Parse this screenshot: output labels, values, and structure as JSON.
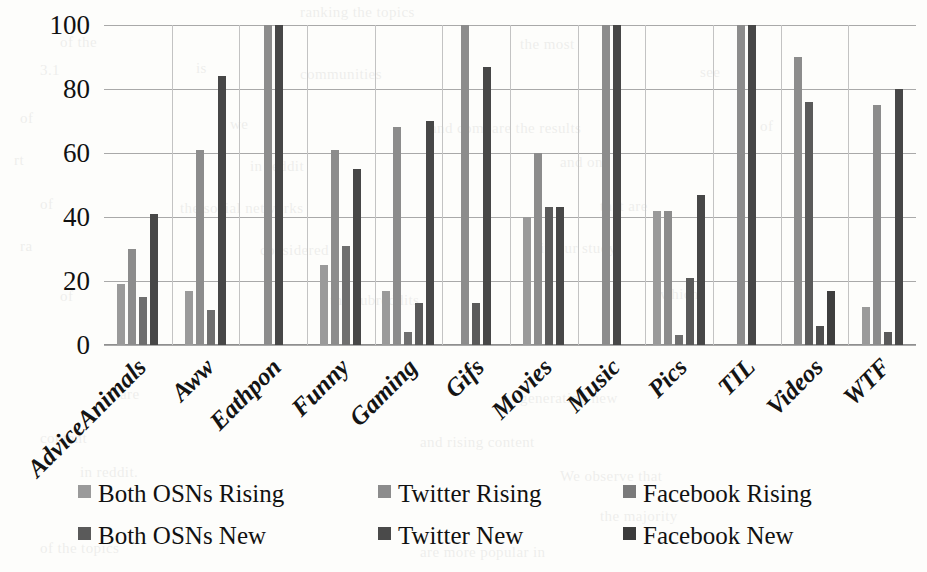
{
  "chart_data": {
    "type": "bar",
    "title": "",
    "subtitle": "",
    "xlabel": "",
    "ylabel": "",
    "grid": true,
    "legend_position": "bottom",
    "ylim": [
      0,
      100
    ],
    "yticks": [
      "0",
      "20",
      "40",
      "60",
      "80",
      "100"
    ],
    "categories": [
      "AdviceAnimals",
      "Aww",
      "Eathpon",
      "Funny",
      "Gaming",
      "Gifs",
      "Movies",
      "Music",
      "Pics",
      "TIL",
      "Videos",
      "WTF"
    ],
    "series": [
      {
        "name": "Both OSNs Rising",
        "color": "#9a9a9a",
        "values": [
          19,
          17,
          null,
          25,
          17,
          null,
          40,
          null,
          42,
          null,
          null,
          12
        ]
      },
      {
        "name": "Twitter Rising",
        "color": "#8c8c8c",
        "values": [
          30,
          61,
          100,
          61,
          68,
          100,
          60,
          100,
          42,
          100,
          90,
          75
        ]
      },
      {
        "name": "Facebook Rising",
        "color": "#787878",
        "values": [
          15,
          null,
          null,
          null,
          4,
          null,
          null,
          null,
          3,
          null,
          null,
          null
        ]
      },
      {
        "name": "Both OSNs New",
        "color": "#555555",
        "values": [
          null,
          11,
          null,
          31,
          13,
          13,
          43,
          null,
          21,
          null,
          6,
          4
        ]
      },
      {
        "name": "Twitter New",
        "color": "#4a4a4a",
        "values": [
          41,
          84,
          100,
          55,
          70,
          87,
          43,
          100,
          47,
          100,
          76,
          80
        ]
      },
      {
        "name": "Facebook New",
        "color": "#3b3b3b",
        "values": [
          null,
          null,
          null,
          null,
          null,
          null,
          null,
          null,
          null,
          null,
          17,
          null
        ]
      }
    ],
    "bars": [
      {
        "category": "AdviceAnimals",
        "items": [
          {
            "series": "Both OSNs Rising",
            "value": 19,
            "color": "#9a9a9a"
          },
          {
            "series": "Twitter Rising",
            "value": 30,
            "color": "#8c8c8c"
          },
          {
            "series": "Facebook Rising",
            "value": 15,
            "color": "#6f6f6f"
          },
          {
            "series": "Twitter New",
            "value": 41,
            "color": "#474747"
          }
        ]
      },
      {
        "category": "Aww",
        "items": [
          {
            "series": "Both OSNs Rising",
            "value": 17,
            "color": "#9a9a9a"
          },
          {
            "series": "Twitter Rising",
            "value": 61,
            "color": "#8c8c8c"
          },
          {
            "series": "Both OSNs New",
            "value": 11,
            "color": "#6f6f6f"
          },
          {
            "series": "Twitter New",
            "value": 84,
            "color": "#474747"
          }
        ]
      },
      {
        "category": "Eathpon",
        "items": [
          {
            "series": "Twitter Rising",
            "value": 100,
            "color": "#8c8c8c"
          },
          {
            "series": "Twitter New",
            "value": 100,
            "color": "#474747"
          }
        ]
      },
      {
        "category": "Funny",
        "items": [
          {
            "series": "Both OSNs Rising",
            "value": 25,
            "color": "#9a9a9a"
          },
          {
            "series": "Twitter Rising",
            "value": 61,
            "color": "#8c8c8c"
          },
          {
            "series": "Both OSNs New",
            "value": 31,
            "color": "#6f6f6f"
          },
          {
            "series": "Twitter New",
            "value": 55,
            "color": "#474747"
          }
        ]
      },
      {
        "category": "Gaming",
        "items": [
          {
            "series": "Both OSNs Rising",
            "value": 17,
            "color": "#9a9a9a"
          },
          {
            "series": "Twitter Rising",
            "value": 68,
            "color": "#8c8c8c"
          },
          {
            "series": "Facebook Rising",
            "value": 4,
            "color": "#6f6f6f"
          },
          {
            "series": "Both OSNs New",
            "value": 13,
            "color": "#5a5a5a"
          },
          {
            "series": "Twitter New",
            "value": 70,
            "color": "#474747"
          }
        ]
      },
      {
        "category": "Gifs",
        "items": [
          {
            "series": "Twitter Rising",
            "value": 100,
            "color": "#8c8c8c"
          },
          {
            "series": "Both OSNs New",
            "value": 13,
            "color": "#5a5a5a"
          },
          {
            "series": "Twitter New",
            "value": 87,
            "color": "#474747"
          }
        ]
      },
      {
        "category": "Movies",
        "items": [
          {
            "series": "Both OSNs Rising",
            "value": 40,
            "color": "#9a9a9a"
          },
          {
            "series": "Twitter Rising",
            "value": 60,
            "color": "#8c8c8c"
          },
          {
            "series": "Both OSNs New",
            "value": 43,
            "color": "#5a5a5a"
          },
          {
            "series": "Twitter New",
            "value": 43,
            "color": "#474747"
          }
        ]
      },
      {
        "category": "Music",
        "items": [
          {
            "series": "Twitter Rising",
            "value": 100,
            "color": "#8c8c8c"
          },
          {
            "series": "Twitter New",
            "value": 100,
            "color": "#474747"
          }
        ]
      },
      {
        "category": "Pics",
        "items": [
          {
            "series": "Both OSNs Rising",
            "value": 42,
            "color": "#9a9a9a"
          },
          {
            "series": "Twitter Rising",
            "value": 42,
            "color": "#8c8c8c"
          },
          {
            "series": "Facebook Rising",
            "value": 3,
            "color": "#6f6f6f"
          },
          {
            "series": "Both OSNs New",
            "value": 21,
            "color": "#5a5a5a"
          },
          {
            "series": "Twitter New",
            "value": 47,
            "color": "#474747"
          }
        ]
      },
      {
        "category": "TIL",
        "items": [
          {
            "series": "Twitter Rising",
            "value": 100,
            "color": "#8c8c8c"
          },
          {
            "series": "Twitter New",
            "value": 100,
            "color": "#474747"
          }
        ]
      },
      {
        "category": "Videos",
        "items": [
          {
            "series": "Twitter Rising",
            "value": 90,
            "color": "#8c8c8c"
          },
          {
            "series": "Both OSNs New",
            "value": 76,
            "color": "#5a5a5a"
          },
          {
            "series": "Twitter New",
            "value": 6,
            "color": "#4f4f4f"
          },
          {
            "series": "Facebook New",
            "value": 17,
            "color": "#3e3e3e"
          }
        ]
      },
      {
        "category": "WTF",
        "items": [
          {
            "series": "Both OSNs Rising",
            "value": 12,
            "color": "#9a9a9a"
          },
          {
            "series": "Twitter Rising",
            "value": 75,
            "color": "#8c8c8c"
          },
          {
            "series": "Both OSNs New",
            "value": 4,
            "color": "#5a5a5a"
          },
          {
            "series": "Twitter New",
            "value": 80,
            "color": "#474747"
          }
        ]
      }
    ]
  },
  "legend": {
    "items": [
      {
        "label": "Both OSNs Rising",
        "color": "#9a9a9a"
      },
      {
        "label": "Twitter Rising",
        "color": "#8c8c8c"
      },
      {
        "label": "Facebook Rising",
        "color": "#7a7a7a"
      },
      {
        "label": "Both OSNs New",
        "color": "#5a5a5a"
      },
      {
        "label": "Twitter New",
        "color": "#4a4a4a"
      },
      {
        "label": "Facebook New",
        "color": "#3b3b3b"
      }
    ]
  },
  "page_bleed": [
    {
      "x": 300,
      "y": 4,
      "text": "ranking the topics"
    },
    {
      "x": 60,
      "y": 34,
      "text": "of the"
    },
    {
      "x": 520,
      "y": 36,
      "text": "the most"
    },
    {
      "x": 40,
      "y": 62,
      "text": "3.1"
    },
    {
      "x": 196,
      "y": 60,
      "text": "is"
    },
    {
      "x": 300,
      "y": 66,
      "text": "communities"
    },
    {
      "x": 700,
      "y": 64,
      "text": "see"
    },
    {
      "x": 20,
      "y": 110,
      "text": "of"
    },
    {
      "x": 230,
      "y": 116,
      "text": "we"
    },
    {
      "x": 430,
      "y": 120,
      "text": "and compare the results"
    },
    {
      "x": 760,
      "y": 118,
      "text": "of"
    },
    {
      "x": 14,
      "y": 152,
      "text": "rt"
    },
    {
      "x": 250,
      "y": 158,
      "text": "in reddit"
    },
    {
      "x": 560,
      "y": 154,
      "text": "and on"
    },
    {
      "x": 40,
      "y": 196,
      "text": "of"
    },
    {
      "x": 180,
      "y": 200,
      "text": "the social networks"
    },
    {
      "x": 600,
      "y": 198,
      "text": "that are"
    },
    {
      "x": 20,
      "y": 238,
      "text": "ra"
    },
    {
      "x": 260,
      "y": 242,
      "text": "considered"
    },
    {
      "x": 540,
      "y": 240,
      "text": "in our study"
    },
    {
      "x": 60,
      "y": 288,
      "text": "of"
    },
    {
      "x": 330,
      "y": 292,
      "text": "the subreddits"
    },
    {
      "x": 660,
      "y": 286,
      "text": "which"
    },
    {
      "x": 120,
      "y": 386,
      "text": "are"
    },
    {
      "x": 520,
      "y": 390,
      "text": "generating new"
    },
    {
      "x": 40,
      "y": 430,
      "text": "content"
    },
    {
      "x": 420,
      "y": 434,
      "text": "and rising content"
    },
    {
      "x": 80,
      "y": 464,
      "text": "in reddit."
    },
    {
      "x": 560,
      "y": 468,
      "text": "We observe that"
    },
    {
      "x": 600,
      "y": 508,
      "text": "the majority"
    },
    {
      "x": 40,
      "y": 540,
      "text": "of the topics"
    },
    {
      "x": 420,
      "y": 544,
      "text": "are more popular in"
    }
  ]
}
